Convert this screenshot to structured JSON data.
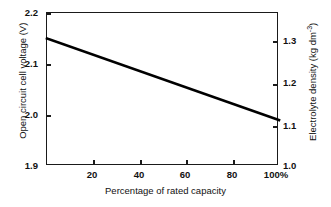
{
  "chart_data": {
    "type": "line",
    "title": "",
    "xlabel": "Percentage of rated capacity",
    "ylabel": "Open circuit cell voltage (V)",
    "y2label_text": "Electrolyte density (kg dm",
    "y2label_sup": "-3",
    "y2label_tail": ")",
    "xlim": [
      0,
      100
    ],
    "ylim": [
      1.9,
      2.2
    ],
    "y2lim": [
      1.0,
      1.3
    ],
    "grid": false,
    "legend": null,
    "x_ticks": [
      "20",
      "40",
      "60",
      "80",
      "100%"
    ],
    "x_tick_values": [
      20,
      40,
      60,
      80,
      100
    ],
    "y_ticks": [
      "2.2",
      "2.1",
      "2.0",
      "1.9"
    ],
    "y_tick_values": [
      2.2,
      2.1,
      2.0,
      1.9
    ],
    "y2_ticks": [
      "1.3",
      "1.2",
      "1.1",
      "1.0"
    ],
    "y2_tick_values": [
      1.3,
      1.2,
      1.1,
      1.0
    ],
    "series": [
      {
        "name": "Open circuit cell voltage",
        "x": [
          0,
          100
        ],
        "values": [
          2.15,
          1.99
        ],
        "y2_values": [
          1.285,
          1.1
        ],
        "color": "#000000"
      }
    ]
  },
  "axes": {
    "left": {
      "title": "Open circuit cell voltage (V)",
      "ticks": [
        "2.2",
        "2.1",
        "2.0",
        "1.9"
      ]
    },
    "right": {
      "title_main": "Electrolyte density (kg dm",
      "title_sup": "-3",
      "title_tail": ")",
      "ticks": [
        "1.3",
        "1.2",
        "1.1",
        "1.0"
      ]
    },
    "bottom": {
      "title": "Percentage of rated capacity",
      "ticks": [
        "20",
        "40",
        "60",
        "80",
        "100%"
      ]
    }
  },
  "colors": {
    "line": "#000000",
    "frame": "#1a1a1a",
    "background": "#ffffff"
  }
}
